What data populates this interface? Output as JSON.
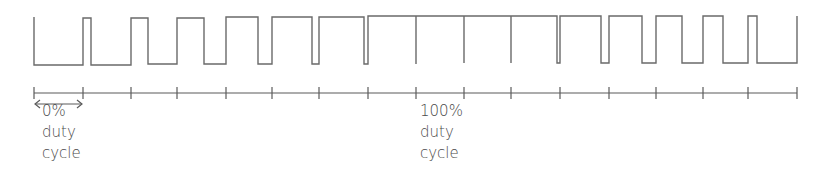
{
  "diagram": {
    "colors": {
      "stroke": "#6a6a6a",
      "text": "#4a4a4a",
      "background": "#ffffff"
    },
    "waveform": {
      "high_y": 17,
      "low_y": 64,
      "path": "M34,17 L34,65 L83,65 L83,18 L91,18 L91,65 L131,65 L131,18 L148,18 L148,64 L177,64 L177,18 L204,18 L204,64 L226,64 L226,17 L258,17 L258,64 L272,64 L272,17 L312,17 L312,64 L319,64 L319,17 L364,17 L364,64 L368,64 L368,16 L416,16 L416,64 L416,16 L464,16 L464,63 L464,16 L511,16 L511,63 L511,16 L557,16 L557,63 L560,63 L560,16 L601,16 L601,63 L609,63 L609,16 L642,16 L642,63 L656,63 L656,16 L682,16 L682,63 L703,63 L703,16 L723,16 L723,63 L748,63 L748,16 L757,16 L757,63 L797,63 L797,16"
    },
    "axis": {
      "y": 93,
      "x_start": 34,
      "x_end": 797,
      "ticks": [
        34,
        83,
        131,
        177,
        226,
        272,
        319,
        368,
        416,
        464,
        511,
        560,
        609,
        656,
        703,
        748,
        797
      ]
    },
    "arrow": {
      "y": 104,
      "x1": 35,
      "x2": 82
    },
    "labels": {
      "zero": {
        "line1": "0%",
        "line2": "duty",
        "line3": "cycle"
      },
      "hundred": {
        "line1": "100%",
        "line2": "duty",
        "line3": "cycle"
      }
    }
  }
}
